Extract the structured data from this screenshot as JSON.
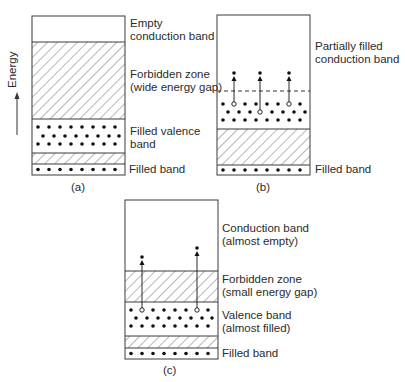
{
  "axis": {
    "label": "Energy",
    "direction": "up"
  },
  "panels": [
    {
      "id": "a",
      "caption": "(a)",
      "labels": {
        "conduction": [
          "Empty",
          "conduction band"
        ],
        "forbidden": [
          "Forbidden zone",
          "(wide energy gap)"
        ],
        "valence": [
          "Filled valence",
          "band"
        ],
        "filled": "Filled band"
      }
    },
    {
      "id": "b",
      "caption": "(b)",
      "labels": {
        "conduction": [
          "Partially filled",
          "conduction band"
        ],
        "filled": "Filled band"
      },
      "excited_electrons": 3
    },
    {
      "id": "c",
      "caption": "(c)",
      "labels": {
        "conduction": [
          "Conduction band",
          "(almost empty)"
        ],
        "forbidden": [
          "Forbidden zone",
          "(small energy gap)"
        ],
        "valence": [
          "Valence band",
          "(almost filled)"
        ],
        "filled": "Filled band"
      },
      "excited_electrons": 2
    }
  ],
  "colors": {
    "line": "#3a3a3a",
    "dot": "#111111",
    "background": "#ffffff"
  }
}
